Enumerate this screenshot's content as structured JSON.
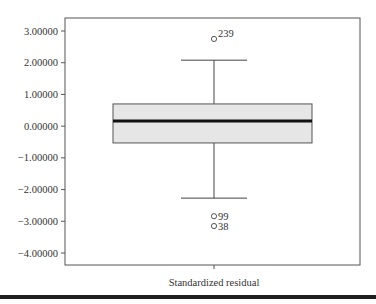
{
  "chart_data": {
    "type": "boxplot",
    "title": "",
    "xlabel": "Standardized residual",
    "ylabel": "",
    "categories": [
      "Standardized residual"
    ],
    "ylim": [
      -4.4,
      3.4
    ],
    "yticks": [
      3,
      2,
      1,
      0,
      -1,
      -2,
      -3,
      -4
    ],
    "ytick_labels": [
      "3.00000",
      "2.00000",
      "1.00000",
      "0.00000",
      "-1.00000",
      "-2.00000",
      "-3.00000",
      "-4.00000"
    ],
    "grid": false,
    "legend": null,
    "boxes": [
      {
        "name": "Standardized residual",
        "q1": -0.53,
        "median": 0.16,
        "q3": 0.7,
        "whisker_low": -2.27,
        "whisker_high": 2.08,
        "outliers": [
          {
            "label": "239",
            "value": 2.75
          },
          {
            "label": "99",
            "value": -2.84
          },
          {
            "label": "38",
            "value": -3.15
          }
        ]
      }
    ],
    "colors": {
      "box_fill": "#e6e6e6",
      "box_stroke": "#555555",
      "median": "#111111",
      "frame": "#555555"
    }
  }
}
